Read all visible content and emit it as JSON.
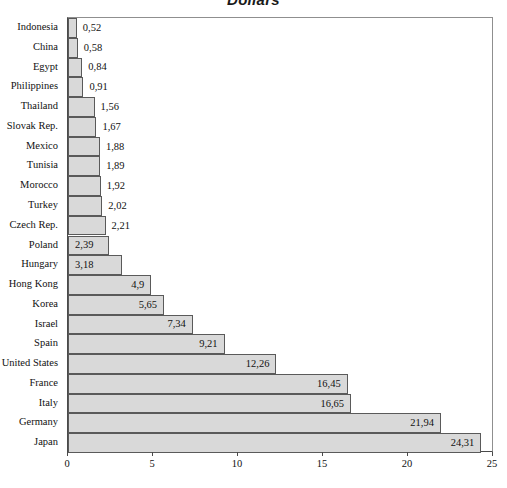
{
  "chart_data": {
    "type": "bar",
    "orientation": "horizontal",
    "title": "Dollars",
    "xlabel": "",
    "ylabel": "",
    "xlim": [
      0,
      25
    ],
    "xticks": [
      "0",
      "5",
      "10",
      "15",
      "20",
      "25"
    ],
    "grid": false,
    "legend": null,
    "decimal_separator": ",",
    "categories": [
      "Indonesia",
      "China",
      "Egypt",
      "Philippines",
      "Thailand",
      "Slovak Rep.",
      "Mexico",
      "Tunisia",
      "Morocco",
      "Turkey",
      "Czech Rep.",
      "Poland",
      "Hungary",
      "Hong Kong",
      "Korea",
      "Israel",
      "Spain",
      "United States",
      "France",
      "Italy",
      "Germany",
      "Japan"
    ],
    "values": [
      0.52,
      0.58,
      0.84,
      0.91,
      1.56,
      1.67,
      1.88,
      1.89,
      1.92,
      2.02,
      2.21,
      2.39,
      3.18,
      4.9,
      5.65,
      7.34,
      9.21,
      12.26,
      16.45,
      16.65,
      21.94,
      24.31
    ],
    "value_labels": [
      "0,52",
      "0,58",
      "0,84",
      "0,91",
      "1,56",
      "1,67",
      "1,88",
      "1,89",
      "1,92",
      "2,02",
      "2,21",
      "2,39",
      "3,18",
      "4,9",
      "5,65",
      "7,34",
      "9,21",
      "12,26",
      "16,45",
      "16,65",
      "21,94",
      "24,31"
    ],
    "label_placement": [
      "outside",
      "outside",
      "outside",
      "outside",
      "outside",
      "outside",
      "outside",
      "outside",
      "outside",
      "outside",
      "outside",
      "inside-left",
      "inside-left",
      "inside-right",
      "inside-right",
      "inside-right",
      "inside-right",
      "inside-right",
      "inside-right",
      "inside-right",
      "inside-right",
      "inside-right"
    ],
    "colors": {
      "bar_fill": "#d9d9d9",
      "bar_border": "#5a5a5a",
      "axis": "#4a4a4a",
      "text": "#111111",
      "background": "#ffffff"
    }
  }
}
